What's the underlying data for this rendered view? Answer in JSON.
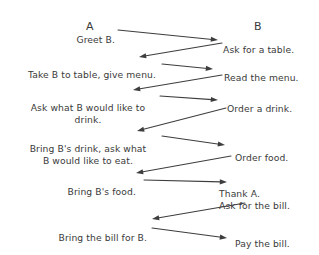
{
  "diagram": {
    "width": 319,
    "height": 255,
    "background_color": "#ffffff",
    "ink_color": "#3a3a3a",
    "arrow_color": "#3d3d3d",
    "lanes": [
      {
        "id": "lane-a",
        "label": "A",
        "x": 90,
        "y": 20
      },
      {
        "id": "lane-b",
        "label": "B",
        "x": 258,
        "y": 20
      }
    ],
    "messages": [
      {
        "id": "msg-greet-b",
        "actor": "A",
        "direction": "a-to-b",
        "text": "Greet B.",
        "lines": [
          "Greet B."
        ],
        "align": "right",
        "x": 115,
        "y": 34
      },
      {
        "id": "msg-ask-for-a-table",
        "actor": "B",
        "direction": "b-to-a",
        "text": "Ask for a table.",
        "lines": [
          "Ask for a table."
        ],
        "align": "left",
        "x": 223,
        "y": 44
      },
      {
        "id": "msg-take-b-to-table",
        "actor": "A",
        "direction": "a-to-b",
        "text": "Take B to table, give menu.",
        "lines": [
          "Take B to table, give menu."
        ],
        "align": "right",
        "x": 156,
        "y": 69
      },
      {
        "id": "msg-read-the-menu",
        "actor": "B",
        "direction": "b-to-a",
        "text": "Read the menu.",
        "lines": [
          "Read the menu."
        ],
        "align": "left",
        "x": 224,
        "y": 72
      },
      {
        "id": "msg-ask-what-b-would-like-to-drink",
        "actor": "A",
        "direction": "a-to-b",
        "text": "Ask what B would like to drink.",
        "lines": [
          "Ask what B would like to",
          "drink."
        ],
        "align": "center",
        "x": 88,
        "y": 102
      },
      {
        "id": "msg-order-a-drink",
        "actor": "B",
        "direction": "b-to-a",
        "text": "Order a drink.",
        "lines": [
          "Order a drink."
        ],
        "align": "left",
        "x": 227,
        "y": 103
      },
      {
        "id": "msg-bring-drink-ask-food",
        "actor": "A",
        "direction": "a-to-b",
        "text": "Bring B's drink, ask what B would like to eat.",
        "lines": [
          "Bring B's drink, ask what",
          "B would like to eat."
        ],
        "align": "center",
        "x": 88,
        "y": 143
      },
      {
        "id": "msg-order-food",
        "actor": "B",
        "direction": "b-to-a",
        "text": "Order food.",
        "lines": [
          "Order food."
        ],
        "align": "left",
        "x": 235,
        "y": 152
      },
      {
        "id": "msg-bring-b-food",
        "actor": "A",
        "direction": "a-to-b",
        "text": "Bring B's food.",
        "lines": [
          "Bring B's food."
        ],
        "align": "right",
        "x": 136,
        "y": 186
      },
      {
        "id": "msg-thank-a-ask-bill",
        "actor": "B",
        "direction": "b-to-a",
        "text": "Thank A. Ask for the bill.",
        "lines": [
          "Thank A.",
          "Ask for the bill."
        ],
        "align": "left",
        "x": 219,
        "y": 188
      },
      {
        "id": "msg-bring-the-bill",
        "actor": "A",
        "direction": "a-to-b",
        "text": "Bring the bill for B.",
        "lines": [
          "Bring the bill for B."
        ],
        "align": "right",
        "x": 147,
        "y": 232
      },
      {
        "id": "msg-pay-the-bill",
        "actor": "B",
        "direction": "b-to-a",
        "text": "Pay the bill.",
        "lines": [
          "Pay the bill."
        ],
        "align": "left",
        "x": 235,
        "y": 238
      }
    ],
    "arrows": [
      {
        "id": "arrow-greet-b",
        "from": "A",
        "to": "B",
        "x1": 118,
        "y1": 30,
        "x2": 218,
        "y2": 40
      },
      {
        "id": "arrow-ask-for-table",
        "from": "B",
        "to": "A",
        "x1": 222,
        "y1": 43,
        "x2": 139,
        "y2": 57
      },
      {
        "id": "arrow-take-to-table",
        "from": "A",
        "to": "B",
        "x1": 162,
        "y1": 64,
        "x2": 213,
        "y2": 69
      },
      {
        "id": "arrow-read-menu",
        "from": "B",
        "to": "A",
        "x1": 222,
        "y1": 75,
        "x2": 133,
        "y2": 90
      },
      {
        "id": "arrow-ask-drink",
        "from": "A",
        "to": "B",
        "x1": 160,
        "y1": 96,
        "x2": 218,
        "y2": 100
      },
      {
        "id": "arrow-order-drink",
        "from": "B",
        "to": "A",
        "x1": 226,
        "y1": 108,
        "x2": 137,
        "y2": 131
      },
      {
        "id": "arrow-bring-drink",
        "from": "A",
        "to": "B",
        "x1": 162,
        "y1": 136,
        "x2": 225,
        "y2": 145
      },
      {
        "id": "arrow-order-food",
        "from": "B",
        "to": "A",
        "x1": 231,
        "y1": 156,
        "x2": 136,
        "y2": 173
      },
      {
        "id": "arrow-bring-food",
        "from": "A",
        "to": "B",
        "x1": 144,
        "y1": 180,
        "x2": 227,
        "y2": 182
      },
      {
        "id": "arrow-ask-bill",
        "from": "B",
        "to": "A",
        "x1": 245,
        "y1": 203,
        "x2": 152,
        "y2": 219
      },
      {
        "id": "arrow-bring-bill",
        "from": "A",
        "to": "B",
        "x1": 152,
        "y1": 228,
        "x2": 227,
        "y2": 238
      }
    ]
  }
}
